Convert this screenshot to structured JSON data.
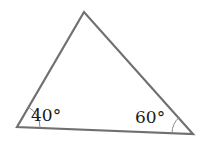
{
  "diagram": {
    "type": "triangle",
    "vertices": {
      "top": [
        84,
        12
      ],
      "left": [
        17,
        127
      ],
      "right": [
        193,
        134
      ]
    },
    "angles": {
      "left": "40°",
      "right": "60°"
    },
    "stroke_color": "#707070"
  }
}
